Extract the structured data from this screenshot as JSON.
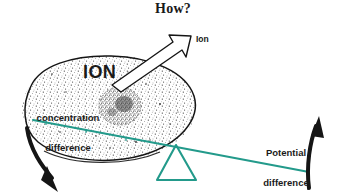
{
  "figure": {
    "title": "How?",
    "domain_kind": "biology-diagram",
    "background_color": "#ffffff"
  },
  "labels": {
    "title": "How?",
    "ion_arrow": "Ion",
    "ion_inside_cell": "ION",
    "concentration_line1": "concentration",
    "concentration_line2": "difference",
    "potential_line1": "Potential",
    "potential_line2": "difference"
  },
  "colors": {
    "ink": "#1a1a1a",
    "teal": "#239a8b",
    "stipple": "#2b2b2b",
    "arrow_fill": "#ffffff",
    "background": "#ffffff"
  },
  "elements": {
    "cell_body": "stippled-ellipse-cell",
    "nucleus": "stippled-nucleus",
    "efflux_arrow": "outlined-arrow-ion-leaving",
    "lever": "teal-lever-beam",
    "fulcrum": "teal-triangle-fulcrum",
    "left_arrow": "black-curved-arrow-down",
    "right_arrow": "black-curved-arrow-up"
  }
}
